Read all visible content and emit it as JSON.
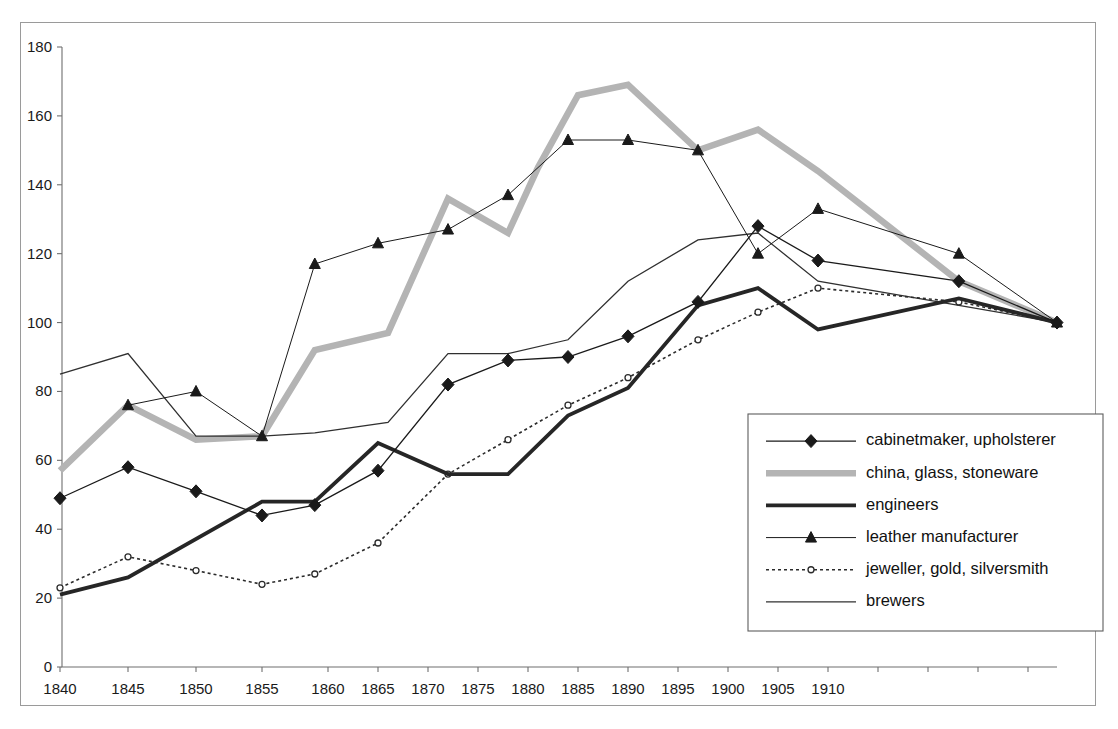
{
  "figure": {
    "title": "",
    "background_color": "#ffffff",
    "border_color": "#9a9a9a"
  },
  "chart_data": {
    "type": "line",
    "title": "",
    "subtitle": "",
    "xlabel": "",
    "ylabel": "",
    "xlim": [
      1838,
      1918
    ],
    "ylim": [
      0,
      180
    ],
    "grid": false,
    "legend_position": "inside-lower-right",
    "y_ticks": [
      0,
      20,
      40,
      60,
      80,
      100,
      120,
      140,
      160,
      180
    ],
    "x_ticks": [
      1840,
      1845,
      1850,
      1855,
      1860,
      1865,
      1870,
      1875,
      1880,
      1885,
      1890,
      1895,
      1900,
      1905,
      1910
    ],
    "x_tick_labels": [
      "1840",
      "1845",
      "1850",
      "1855",
      "1860",
      "1865",
      "1870",
      "1875",
      "1880",
      "1885",
      "1890",
      "1895",
      "1900",
      "1905",
      "1910"
    ],
    "series": [
      {
        "name": "cabinetmaker, upholsterer",
        "color": "#1a1a1a",
        "line_width": 1.3,
        "dash": "none",
        "marker": "diamond",
        "x": [
          1840,
          1845,
          1850,
          1855,
          1859,
          1865,
          1872,
          1878,
          1884,
          1890,
          1897,
          1903,
          1909,
          1914,
          1917
        ],
        "y": [
          49,
          58,
          51,
          44,
          47,
          57,
          82,
          89,
          90,
          96,
          106,
          128,
          118,
          112,
          100
        ]
      },
      {
        "name": "china, glass, stoneware",
        "color": "#b4b4b4",
        "line_width": 6.5,
        "dash": "none",
        "marker": "none",
        "x": [
          1840,
          1845,
          1850,
          1855,
          1859,
          1866,
          1872,
          1878,
          1881,
          1885,
          1890,
          1897,
          1903,
          1909,
          1914,
          1917
        ],
        "y": [
          57,
          76,
          66,
          67,
          92,
          97,
          136,
          126,
          145,
          166,
          169,
          150,
          156,
          144,
          112,
          100
        ]
      },
      {
        "name": "engineers",
        "color": "#262626",
        "line_width": 3.8,
        "dash": "none",
        "marker": "none",
        "x": [
          1840,
          1845,
          1855,
          1859,
          1865,
          1872,
          1878,
          1884,
          1890,
          1897,
          1903,
          1909,
          1914,
          1917
        ],
        "y": [
          21,
          26,
          48,
          48,
          65,
          56,
          56,
          73,
          81,
          105,
          110,
          98,
          107,
          100
        ]
      },
      {
        "name": "leather manufacturer",
        "color": "#1a1a1a",
        "line_width": 1.0,
        "dash": "none",
        "marker": "triangle",
        "x": [
          1845,
          1850,
          1855,
          1859,
          1865,
          1872,
          1878,
          1884,
          1890,
          1897,
          1903,
          1909,
          1914,
          1917
        ],
        "y": [
          76,
          80,
          67,
          117,
          123,
          127,
          137,
          153,
          153,
          150,
          120,
          133,
          120,
          100
        ]
      },
      {
        "name": "jeweller, gold, silversmith",
        "color": "#2b2b2b",
        "line_width": 1.6,
        "dash": "3,3",
        "marker": "circle-open",
        "x": [
          1840,
          1845,
          1850,
          1855,
          1859,
          1865,
          1872,
          1878,
          1884,
          1890,
          1897,
          1903,
          1909,
          1914,
          1917
        ],
        "y": [
          23,
          32,
          28,
          24,
          27,
          36,
          56,
          66,
          76,
          84,
          95,
          103,
          110,
          106,
          100
        ]
      },
      {
        "name": "brewers",
        "color": "#303030",
        "line_width": 1.3,
        "dash": "none",
        "marker": "none",
        "x": [
          1840,
          1845,
          1850,
          1855,
          1859,
          1866,
          1872,
          1878,
          1884,
          1890,
          1897,
          1903,
          1909,
          1914,
          1917
        ],
        "y": [
          85,
          91,
          67,
          67,
          68,
          71,
          91,
          91,
          95,
          112,
          124,
          126,
          112,
          105,
          100
        ]
      }
    ]
  },
  "legend": {
    "entries": [
      {
        "label": "cabinetmaker, upholsterer",
        "style": "thin-diamond"
      },
      {
        "label": "china, glass, stoneware",
        "style": "thick-gray"
      },
      {
        "label": "engineers",
        "style": "thick-black"
      },
      {
        "label": "leather manufacturer",
        "style": "thin-triangle"
      },
      {
        "label": "jeweller, gold, silversmith",
        "style": "dashed-circle"
      },
      {
        "label": "brewers",
        "style": "thin-plain"
      }
    ]
  }
}
